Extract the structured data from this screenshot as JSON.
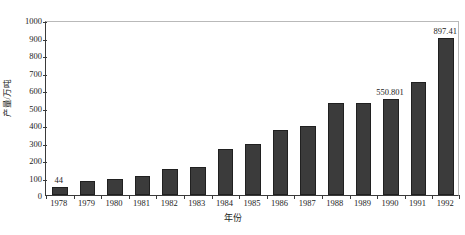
{
  "chart_data": {
    "type": "bar",
    "title": "",
    "xlabel": "年份",
    "ylabel": "产量/万吨",
    "ylim": [
      0,
      1000
    ],
    "ytick_step": 100,
    "grid": false,
    "legend": null,
    "bar_color": "#3b3b3b",
    "bar_edge_color": "#202020",
    "frame_color": "#b9b9b9",
    "axis_color": "#3a3a3a",
    "categories": [
      "1978",
      "1979",
      "1980",
      "1981",
      "1982",
      "1983",
      "1984",
      "1985",
      "1986",
      "1987",
      "1988",
      "1989",
      "1990",
      "1991",
      "1992"
    ],
    "values": [
      44,
      79,
      89,
      107,
      148,
      158,
      265,
      292,
      372,
      393,
      523,
      523,
      550.801,
      645,
      897.41
    ],
    "ytick_labels": [
      "1000",
      "900",
      "800",
      "700",
      "600",
      "500",
      "400",
      "300",
      "200",
      "100",
      "0"
    ],
    "ytick_values": [
      1000,
      900,
      800,
      700,
      600,
      500,
      400,
      300,
      200,
      100,
      0
    ],
    "annotations": [
      {
        "category": "1978",
        "label": "44",
        "value": 44
      },
      {
        "category": "1990",
        "label": "550.801",
        "value": 550.801
      },
      {
        "category": "1992",
        "label": "897.41",
        "value": 897.41
      }
    ]
  }
}
